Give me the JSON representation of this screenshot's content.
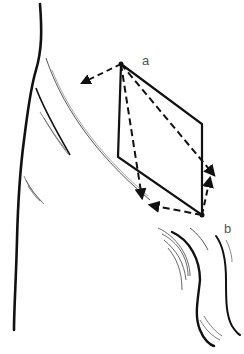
{
  "figure": {
    "labels": {
      "a": "a",
      "b": "b"
    },
    "colors": {
      "ink": "#111111",
      "hatch": "#555555",
      "label": "#555555",
      "background": "#ffffff"
    }
  }
}
